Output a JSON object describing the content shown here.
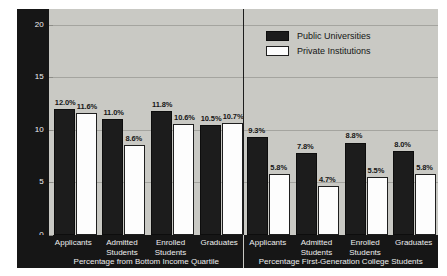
{
  "chart_data": {
    "type": "bar",
    "title": "",
    "xlabel": "",
    "ylabel": "",
    "ylim": [
      0,
      21.5
    ],
    "yticks": [
      "0",
      "5",
      "10",
      "15",
      "20"
    ],
    "ytick_values": [
      0,
      5,
      10,
      15,
      20
    ],
    "grid": true,
    "legend_position": "top-right",
    "legend": [
      {
        "name": "Public Universities",
        "color": "#1c1c1c"
      },
      {
        "name": "Private Institutions",
        "color": "#fdfdfd"
      }
    ],
    "panels": [
      {
        "caption": "Percentage from Bottom Income Quartile",
        "categories": [
          "Applicants",
          "Admitted Students",
          "Enrolled Students",
          "Graduates"
        ],
        "series": [
          {
            "name": "Public Universities",
            "values": [
              12.0,
              11.0,
              11.8,
              10.5
            ],
            "labels": [
              "12.0%",
              "11.0%",
              "11.8%",
              "10.5%"
            ]
          },
          {
            "name": "Private Institutions",
            "values": [
              11.6,
              8.6,
              10.6,
              10.7
            ],
            "labels": [
              "11.6%",
              "8.6%",
              "10.6%",
              "10.7%"
            ]
          }
        ]
      },
      {
        "caption": "Percentage First-Generation College Students",
        "categories": [
          "Applicants",
          "Admitted Students",
          "Enrolled Students",
          "Graduates"
        ],
        "series": [
          {
            "name": "Public Universities",
            "values": [
              9.3,
              7.8,
              8.8,
              8.0
            ],
            "labels": [
              "9.3%",
              "7.8%",
              "8.8%",
              "8.0%"
            ]
          },
          {
            "name": "Private Institutions",
            "values": [
              5.8,
              4.7,
              5.5,
              5.8
            ],
            "labels": [
              "5.8%",
              "4.7%",
              "5.5%",
              "5.8%"
            ]
          }
        ]
      }
    ]
  },
  "colors": {
    "figure_background": "#c9c9c4",
    "axis_band": "#161616",
    "gridline": "#a4a49f",
    "public_bar": "#1c1c1c",
    "private_bar": "#fdfdfd",
    "axis_text": "#f2f2f2",
    "value_text": "#161616"
  }
}
